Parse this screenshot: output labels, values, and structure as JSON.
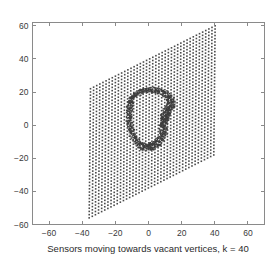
{
  "figure": {
    "caption": "Sensors moving towards vacant vertices, k = 40",
    "background_color": "#ffffff",
    "axis_color": "#8a8a8a",
    "marker_color": "#4a4a4a"
  },
  "chart_data": {
    "type": "scatter",
    "title": "",
    "subtitle": "",
    "xlabel": "Sensors moving towards vacant vertices, k = 40",
    "ylabel": "",
    "xlim": [
      -70,
      70
    ],
    "ylim": [
      -60,
      62
    ],
    "grid": false,
    "legend": null,
    "xticks": [
      -60,
      -40,
      -20,
      0,
      20,
      40,
      60
    ],
    "xticklabels": [
      "-60",
      "-40",
      "-20",
      "0",
      "20",
      "40",
      "60"
    ],
    "yticks": [
      -60,
      -40,
      -20,
      0,
      20,
      40,
      60
    ],
    "yticklabels": [
      "-60",
      "-40",
      "-20",
      "0",
      "20",
      "40",
      "60"
    ],
    "series": [
      {
        "name": "vacant vertices lattice",
        "marker": "square-dot",
        "color": "#4a4a4a",
        "size": 1.6,
        "description": "Sheared parallelogram lattice of vacant target vertices",
        "lattice": {
          "corners": [
            [
              -35,
              22
            ],
            [
              41,
              61
            ],
            [
              41,
              -20
            ],
            [
              -36,
              -57
            ]
          ],
          "u_steps": 41,
          "v_steps": 41,
          "u_vector": [
            1.88,
            0.95
          ],
          "v_vector": [
            -0.02,
            -1.95
          ],
          "origin": [
            -35,
            22
          ]
        }
      },
      {
        "name": "sensors",
        "marker": "dot",
        "color": "#3d3d3d",
        "size": 1.4,
        "description": "Sensors clustered along a closed ring contour, densest on right and lower-right arcs",
        "ring_outer": [
          [
            -10.5,
            17.5
          ],
          [
            -7.0,
            20.5
          ],
          [
            -3.0,
            22.0
          ],
          [
            1.0,
            22.5
          ],
          [
            5.0,
            22.0
          ],
          [
            9.0,
            21.0
          ],
          [
            12.5,
            19.5
          ],
          [
            15.0,
            17.0
          ],
          [
            16.5,
            14.0
          ],
          [
            16.0,
            11.0
          ],
          [
            14.0,
            8.5
          ],
          [
            12.5,
            5.5
          ],
          [
            11.5,
            2.0
          ],
          [
            11.0,
            -2.0
          ],
          [
            10.5,
            -6.0
          ],
          [
            9.0,
            -9.5
          ],
          [
            6.5,
            -12.5
          ],
          [
            3.0,
            -14.5
          ],
          [
            -0.5,
            -15.5
          ],
          [
            -4.0,
            -15.0
          ],
          [
            -7.0,
            -13.0
          ],
          [
            -9.5,
            -10.0
          ],
          [
            -11.5,
            -6.0
          ],
          [
            -12.5,
            -1.5
          ],
          [
            -13.0,
            3.0
          ],
          [
            -13.0,
            7.5
          ],
          [
            -12.5,
            12.0
          ],
          [
            -11.5,
            15.5
          ]
        ],
        "ring_inner": [
          [
            -9.0,
            16.0
          ],
          [
            -5.5,
            18.5
          ],
          [
            -2.0,
            19.8
          ],
          [
            1.5,
            20.0
          ],
          [
            5.0,
            19.5
          ],
          [
            8.0,
            18.5
          ],
          [
            10.5,
            16.5
          ],
          [
            11.5,
            14.0
          ],
          [
            11.0,
            11.5
          ],
          [
            9.5,
            9.0
          ],
          [
            8.0,
            6.0
          ],
          [
            7.5,
            2.5
          ],
          [
            7.0,
            -1.5
          ],
          [
            6.5,
            -5.0
          ],
          [
            5.0,
            -8.0
          ],
          [
            2.5,
            -10.5
          ],
          [
            -0.5,
            -11.5
          ],
          [
            -3.5,
            -11.0
          ],
          [
            -6.0,
            -9.0
          ],
          [
            -8.0,
            -5.5
          ],
          [
            -9.5,
            -1.5
          ],
          [
            -10.0,
            2.5
          ],
          [
            -10.0,
            7.0
          ],
          [
            -9.8,
            11.5
          ]
        ],
        "dense_arcs": [
          {
            "name": "right-limb",
            "from": [
              15.0,
              14.0
            ],
            "to": [
              9.0,
              -9.0
            ],
            "weight": 1.0
          },
          {
            "name": "bottom-limb",
            "from": [
              9.0,
              -9.0
            ],
            "to": [
              -6.0,
              -14.0
            ],
            "weight": 0.9
          },
          {
            "name": "top-cap",
            "from": [
              -8.0,
              19.0
            ],
            "to": [
              13.0,
              19.0
            ],
            "weight": 0.5
          }
        ],
        "approx_count": 520
      }
    ]
  }
}
